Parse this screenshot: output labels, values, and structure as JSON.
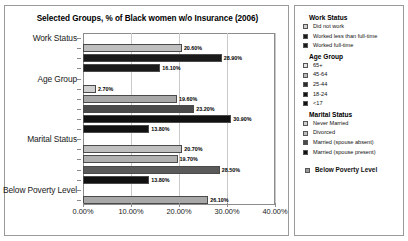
{
  "chart_data": {
    "type": "bar",
    "orientation": "horizontal",
    "title": "Selected Groups, % of Black women w/o Insurance (2006)",
    "xlabel": "",
    "ylabel": "",
    "xlim": [
      0,
      40
    ],
    "xticks": [
      "0.00%",
      "10.00%",
      "20.00%",
      "30.00%",
      "40.00%"
    ],
    "xtick_values": [
      0,
      10,
      20,
      30,
      40
    ],
    "grid": true,
    "legend_position": "right",
    "categories": [
      "Work Status",
      "Age Group",
      "Marital Status",
      "Below Poverty Level"
    ],
    "groups": [
      {
        "category": "Work Status",
        "bars": [
          {
            "label": "Did not work",
            "value": 20.6,
            "value_label": "20.60%",
            "color": "#bfbfbf"
          },
          {
            "label": "Worked less than full-time",
            "value": 28.9,
            "value_label": "28.90%",
            "color": "#1a1a1a"
          },
          {
            "label": "Worked full-time",
            "value": 16.1,
            "value_label": "16.10%",
            "color": "#1a1a1a"
          }
        ]
      },
      {
        "category": "Age Group",
        "bars": [
          {
            "label": "65+",
            "value": 2.7,
            "value_label": "2.70%",
            "color": "#d0d0d0"
          },
          {
            "label": "45-64",
            "value": 19.6,
            "value_label": "19.60%",
            "color": "#a8a8a8"
          },
          {
            "label": "25-44",
            "value": 23.2,
            "value_label": "23.20%",
            "color": "#4a4a4a"
          },
          {
            "label": "18-24",
            "value": 30.9,
            "value_label": "30.90%",
            "color": "#111111"
          },
          {
            "label": "<17",
            "value": 13.8,
            "value_label": "13.80%",
            "color": "#111111"
          }
        ]
      },
      {
        "category": "Marital Status",
        "bars": [
          {
            "label": "Never Married",
            "value": 20.7,
            "value_label": "20.70%",
            "color": "#bfbfbf"
          },
          {
            "label": "Divorced",
            "value": 19.7,
            "value_label": "19.70%",
            "color": "#b0b0b0"
          },
          {
            "label": "Married (spouse absent)",
            "value": 28.5,
            "value_label": "28.50%",
            "color": "#5a5a5a"
          },
          {
            "label": "Married (spouse present)",
            "value": 13.8,
            "value_label": "13.80%",
            "color": "#111111"
          }
        ]
      },
      {
        "category": "Below Poverty Level",
        "bars": [
          {
            "label": "Below Poverty Level",
            "value": 26.1,
            "value_label": "26.10%",
            "color": "#a8a8a8"
          }
        ]
      }
    ]
  },
  "legend": {
    "groups": [
      {
        "title": "Work Status",
        "items": [
          {
            "label": "Did not work",
            "color": "#cfcfcf"
          },
          {
            "label": "Worked less than full-time",
            "color": "#1a1a1a"
          },
          {
            "label": "Worked full-time",
            "color": "#1a1a1a"
          }
        ]
      },
      {
        "title": "Age Group",
        "items": [
          {
            "label": "65+",
            "color": "#e2e2e2"
          },
          {
            "label": "45-64",
            "color": "#b8b8b8"
          },
          {
            "label": "25-44",
            "color": "#2b2b2b"
          },
          {
            "label": "18-24",
            "color": "#111111"
          },
          {
            "label": "<17",
            "color": "#111111"
          }
        ]
      },
      {
        "title": "Marital Status",
        "items": [
          {
            "label": "Never Married",
            "color": "#cfcfcf"
          },
          {
            "label": "Divorced",
            "color": "#bdbdbd"
          },
          {
            "label": "Married (spouse absent)",
            "color": "#4a4a4a"
          },
          {
            "label": "Married (spouse present)",
            "color": "#111111"
          }
        ]
      }
    ],
    "footer": {
      "label": "Below Poverty Level",
      "color": "#9a9a9a"
    }
  }
}
